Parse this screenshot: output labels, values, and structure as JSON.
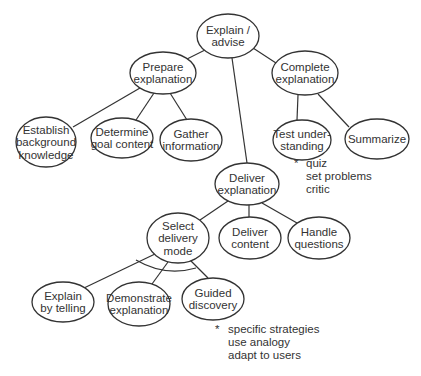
{
  "diagram": {
    "type": "hierarchical-task-tree",
    "nodes": [
      {
        "id": "explain",
        "lines": [
          "Explain /",
          "advise"
        ],
        "cx": 228,
        "cy": 36,
        "rx": 31,
        "ry": 22
      },
      {
        "id": "prepare",
        "lines": [
          "Prepare",
          "explanation"
        ],
        "cx": 163,
        "cy": 73,
        "rx": 33,
        "ry": 21
      },
      {
        "id": "complete",
        "lines": [
          "Complete",
          "explanation"
        ],
        "cx": 305,
        "cy": 73,
        "rx": 33,
        "ry": 22
      },
      {
        "id": "establish",
        "lines": [
          "Establish",
          "background",
          "knowledge"
        ],
        "cx": 46,
        "cy": 142,
        "rx": 30,
        "ry": 25
      },
      {
        "id": "determine",
        "lines": [
          "Determine",
          "goal content"
        ],
        "cx": 122,
        "cy": 138,
        "rx": 31,
        "ry": 20
      },
      {
        "id": "gather",
        "lines": [
          "Gather",
          "information"
        ],
        "cx": 191,
        "cy": 140,
        "rx": 31,
        "ry": 21
      },
      {
        "id": "test",
        "lines": [
          "Test under-",
          "standing"
        ],
        "cx": 302,
        "cy": 140,
        "rx": 29,
        "ry": 20
      },
      {
        "id": "summarize",
        "lines": [
          "Summarize"
        ],
        "cx": 377,
        "cy": 139,
        "rx": 32,
        "ry": 20
      },
      {
        "id": "deliver",
        "lines": [
          "Deliver",
          "explanation"
        ],
        "cx": 247,
        "cy": 184,
        "rx": 32,
        "ry": 21
      },
      {
        "id": "select",
        "lines": [
          "Select",
          "delivery",
          "mode"
        ],
        "cx": 178,
        "cy": 238,
        "rx": 31,
        "ry": 25
      },
      {
        "id": "content",
        "lines": [
          "Deliver",
          "content"
        ],
        "cx": 250,
        "cy": 238,
        "rx": 31,
        "ry": 21
      },
      {
        "id": "questions",
        "lines": [
          "Handle",
          "questions"
        ],
        "cx": 319,
        "cy": 238,
        "rx": 31,
        "ry": 21
      },
      {
        "id": "telling",
        "lines": [
          "Explain",
          "by telling"
        ],
        "cx": 63,
        "cy": 302,
        "rx": 31,
        "ry": 20
      },
      {
        "id": "demonstrate",
        "lines": [
          "Demonstrate",
          "explanation"
        ],
        "cx": 139,
        "cy": 304,
        "rx": 31,
        "ry": 22
      },
      {
        "id": "guided",
        "lines": [
          "Guided",
          "discovery"
        ],
        "cx": 213,
        "cy": 299,
        "rx": 31,
        "ry": 21
      }
    ],
    "edges": [
      {
        "x1": 205,
        "y1": 50,
        "x2": 187,
        "y2": 59
      },
      {
        "x1": 253,
        "y1": 48,
        "x2": 276,
        "y2": 63
      },
      {
        "x1": 232,
        "y1": 58,
        "x2": 247,
        "y2": 163
      },
      {
        "x1": 140,
        "y1": 88,
        "x2": 73,
        "y2": 127
      },
      {
        "x1": 154,
        "y1": 93,
        "x2": 136,
        "y2": 120
      },
      {
        "x1": 170,
        "y1": 93,
        "x2": 187,
        "y2": 120
      },
      {
        "x1": 298,
        "y1": 95,
        "x2": 297,
        "y2": 120
      },
      {
        "x1": 318,
        "y1": 94,
        "x2": 349,
        "y2": 127
      },
      {
        "x1": 228,
        "y1": 201,
        "x2": 200,
        "y2": 220
      },
      {
        "x1": 249,
        "y1": 205,
        "x2": 249,
        "y2": 217
      },
      {
        "x1": 262,
        "y1": 203,
        "x2": 297,
        "y2": 223
      },
      {
        "x1": 155,
        "y1": 254,
        "x2": 84,
        "y2": 288
      },
      {
        "x1": 168,
        "y1": 262,
        "x2": 152,
        "y2": 284
      },
      {
        "x1": 190,
        "y1": 260,
        "x2": 208,
        "y2": 278
      }
    ],
    "arc": {
      "path": "M 136 260 Q 165 277 196 268",
      "meaning": "alternative-selection"
    },
    "notes": [
      {
        "id": "test-note",
        "marker": "*",
        "lines": [
          "quiz",
          "set problems",
          "critic"
        ],
        "x": 306,
        "y": 167,
        "marker_x": 294
      },
      {
        "id": "guided-note",
        "marker": "*",
        "lines": [
          "specific  strategies",
          "use analogy",
          "adapt to users"
        ],
        "x": 228,
        "y": 333,
        "marker_x": 215
      }
    ]
  },
  "colors": {
    "stroke": "#333333",
    "text": "#333333",
    "background": "#ffffff"
  }
}
